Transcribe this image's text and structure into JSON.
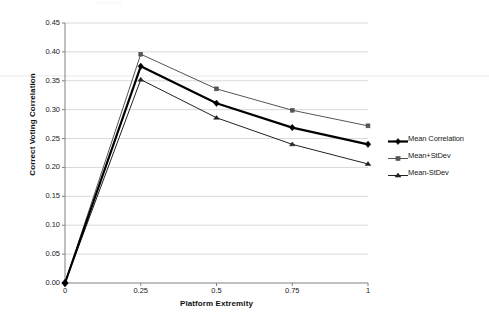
{
  "chart_data": {
    "type": "line",
    "title": "",
    "xlabel": "Platform Extremity",
    "ylabel": "Correct Voting Correlation",
    "x": [
      0,
      0.25,
      0.5,
      0.75,
      1
    ],
    "xtick_labels": [
      "0",
      "0.25",
      "0.5",
      "0.75",
      "1"
    ],
    "xlim": [
      0,
      1
    ],
    "ylim": [
      0,
      0.45
    ],
    "ytick_labels": [
      "0.00",
      "0.05",
      "0.10",
      "0.15",
      "0.20",
      "0.25",
      "0.30",
      "0.35",
      "0.40",
      "0.45"
    ],
    "ytick_values": [
      0,
      0.05,
      0.1,
      0.15,
      0.2,
      0.25,
      0.3,
      0.35,
      0.4,
      0.45
    ],
    "grid": "horizontal",
    "legend_position": "right",
    "series": [
      {
        "name": "Mean Correlation",
        "marker": "diamond",
        "color": "#000000",
        "line_width": 2.2,
        "values": [
          0.0,
          0.375,
          0.311,
          0.269,
          0.24
        ]
      },
      {
        "name": "Mean+StDev",
        "marker": "square",
        "color": "#555555",
        "line_width": 1.0,
        "values": [
          0.0,
          0.396,
          0.336,
          0.299,
          0.272
        ]
      },
      {
        "name": "Mean-StDev",
        "marker": "triangle",
        "color": "#222222",
        "line_width": 1.0,
        "values": [
          0.0,
          0.352,
          0.286,
          0.24,
          0.206
        ]
      }
    ]
  },
  "axes": {
    "y_title": "Correct Voting Correlation",
    "x_title": "Platform Extremity",
    "y_labels": [
      "0.45",
      "0.40",
      "0.35",
      "0.30",
      "0.25",
      "0.20",
      "0.15",
      "0.10",
      "0.05",
      "0.00"
    ],
    "x_labels": [
      "0",
      "0.25",
      "0.5",
      "0.75",
      "1"
    ]
  },
  "legend": {
    "items": [
      {
        "label": "Mean Correlation",
        "marker": "diamond-marker-icon"
      },
      {
        "label": "Mean+StDev",
        "marker": "square-marker-icon"
      },
      {
        "label": "Mean-StDev",
        "marker": "triangle-marker-icon"
      }
    ]
  },
  "colors": {
    "grid": "#c9c9c9",
    "axis": "#808080",
    "series_primary": "#000000",
    "series_upper": "#555555",
    "series_lower": "#222222",
    "background": "#ffffff"
  }
}
